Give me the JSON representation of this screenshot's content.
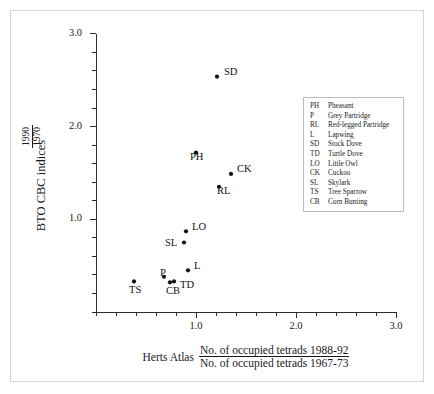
{
  "chart_data": {
    "type": "scatter",
    "title": "",
    "xlabel": "Herts Atlas No. of occupied tetrads 1988-92 / No. of occupied tetrads 1967-73",
    "ylabel": "BTO CBC indices 1990 / 1970",
    "xlim": [
      0.0,
      3.0
    ],
    "ylim": [
      0.0,
      3.0
    ],
    "xticks": [
      1.0,
      2.0,
      3.0
    ],
    "xtick_labels": [
      "1.0",
      "2.0",
      "3.0"
    ],
    "yticks": [
      1.0,
      2.0,
      3.0
    ],
    "ytick_labels": [
      "1.0",
      "2.0",
      "3.0"
    ],
    "minor_tick_step": 0.2,
    "grid": false,
    "legend_position": "upper right",
    "marker": "filled-circle",
    "marker_color": "#111111",
    "points": [
      {
        "code": "SD",
        "name": "Stock Dove",
        "x": 1.21,
        "y": 2.54,
        "label_dx": 7,
        "label_dy": -5
      },
      {
        "code": "PH",
        "name": "Pheasant",
        "x": 1.0,
        "y": 1.72,
        "label_dx": -6,
        "label_dy": 4
      },
      {
        "code": "CK",
        "name": "Cuckoo",
        "x": 1.35,
        "y": 1.49,
        "label_dx": 6,
        "label_dy": -5
      },
      {
        "code": "RL",
        "name": "Red-legged Partridge",
        "x": 1.23,
        "y": 1.35,
        "label_dx": -2,
        "label_dy": 4
      },
      {
        "code": "LO",
        "name": "Little Owl",
        "x": 0.9,
        "y": 0.87,
        "label_dx": 6,
        "label_dy": -4
      },
      {
        "code": "SL",
        "name": "Skylark",
        "x": 0.88,
        "y": 0.75,
        "label_dx": -19,
        "label_dy": 1
      },
      {
        "code": "L",
        "name": "Lapwing",
        "x": 0.92,
        "y": 0.45,
        "label_dx": 6,
        "label_dy": -4
      },
      {
        "code": "P",
        "name": "Grey Partridge",
        "x": 0.68,
        "y": 0.38,
        "label_dx": -4,
        "label_dy": -4
      },
      {
        "code": "TD",
        "name": "Turtle Dove",
        "x": 0.78,
        "y": 0.33,
        "label_dx": 6,
        "label_dy": 4
      },
      {
        "code": "CB",
        "name": "Corn Bunting",
        "x": 0.74,
        "y": 0.32,
        "label_dx": -4,
        "label_dy": 9
      },
      {
        "code": "TS",
        "name": "Tree Sparrow",
        "x": 0.38,
        "y": 0.33,
        "label_dx": -5,
        "label_dy": 9
      }
    ]
  },
  "axes": {
    "y_title": "BTO CBC indices",
    "y_fraction_numerator": "1990",
    "y_fraction_denominator": "1970",
    "x_title_prefix": "Herts Atlas",
    "x_fraction_numerator": "No. of occupied tetrads 1988-92",
    "x_fraction_denominator": "No. of occupied tetrads 1967-73"
  },
  "legend": {
    "rows": [
      {
        "code": "PH",
        "name": "Pheasant"
      },
      {
        "code": "P",
        "name": "Grey Partridge"
      },
      {
        "code": "RL",
        "name": "Red-legged Partridge"
      },
      {
        "code": "L",
        "name": "Lapwing"
      },
      {
        "code": "SD",
        "name": "Stock Dove"
      },
      {
        "code": "TD",
        "name": "Turtle Dove"
      },
      {
        "code": "LO",
        "name": "Little Owl"
      },
      {
        "code": "CK",
        "name": "Cuckoo"
      },
      {
        "code": "SL",
        "name": "Skylark"
      },
      {
        "code": "TS",
        "name": "Tree Sparrow"
      },
      {
        "code": "CB",
        "name": "Corn Bunting"
      }
    ]
  },
  "colors": {
    "marker": "#111111",
    "axis": "#2b2b2b",
    "frame": "#d7d7d7",
    "legend_border": "#bdbdbd",
    "text": "#1a1a1a",
    "background": "#ffffff"
  }
}
